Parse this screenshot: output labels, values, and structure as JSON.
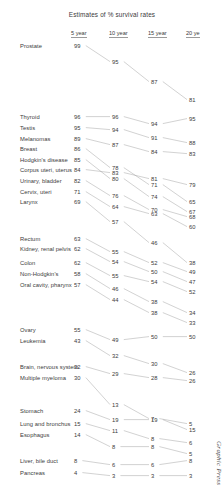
{
  "title": "Estimates of % survival rates",
  "credit": "Graphic Press",
  "columns": [
    {
      "label": "5 year",
      "x": 78
    },
    {
      "label": "10 year",
      "x": 116
    },
    {
      "label": "15 year",
      "x": 155
    },
    {
      "label": "20 ye",
      "x": 193
    }
  ],
  "axis": {
    "header_y": 30
  },
  "style": {
    "line_color": "#9a9a9a",
    "text_color": "#3b3b3b",
    "background": "#ffffff"
  },
  "chart_data": {
    "type": "line",
    "title": "Estimates of % survival rates",
    "xlabel": "",
    "ylabel": "",
    "categories": [
      "5 year",
      "10 year",
      "15 year",
      "20 year"
    ],
    "grid": false,
    "legend": "none",
    "note": "Tufte slopegraph of cancer survival rates by site",
    "series": [
      {
        "name": "Prostate",
        "values": [
          99,
          95,
          87,
          81
        ],
        "y": [
          47,
          63,
          83,
          101
        ]
      },
      {
        "name": "Thyroid",
        "values": [
          96,
          96,
          94,
          95
        ],
        "y": [
          118,
          118,
          125,
          120
        ]
      },
      {
        "name": "Testis",
        "values": [
          95,
          94,
          91,
          88
        ],
        "y": [
          129,
          131,
          139,
          144
        ]
      },
      {
        "name": "Melanomas",
        "values": [
          89,
          87,
          84,
          83
        ],
        "y": [
          140,
          146,
          153,
          155
        ]
      },
      {
        "name": "Breast",
        "values": [
          86,
          78,
          71,
          65
        ],
        "y": [
          150,
          169,
          186,
          203
        ]
      },
      {
        "name": "Hodgkin's disease",
        "values": [
          85,
          80,
          74,
          67
        ],
        "y": [
          161,
          180,
          198,
          213
        ]
      },
      {
        "name": "Corpus uteri, uterus",
        "values": [
          84,
          83,
          81,
          79
        ],
        "y": [
          171,
          174,
          180,
          186
        ]
      },
      {
        "name": "Urinary, bladder",
        "values": [
          82,
          76,
          70,
          68
        ],
        "y": [
          182,
          197,
          211,
          218
        ]
      },
      {
        "name": "Cervix, uteri",
        "values": [
          71,
          64,
          63,
          60
        ],
        "y": [
          193,
          208,
          215,
          228
        ]
      },
      {
        "name": "Larynx",
        "values": [
          69,
          57,
          46,
          38
        ],
        "y": [
          203,
          223,
          244,
          264
        ]
      },
      {
        "name": "Rectum",
        "values": [
          63,
          55,
          52,
          49
        ],
        "y": [
          240,
          253,
          264,
          273
        ]
      },
      {
        "name": "Kidney, renal pelvis",
        "values": [
          62,
          54,
          50,
          47
        ],
        "y": [
          250,
          263,
          273,
          283
        ]
      },
      {
        "name": "Colon",
        "values": [
          62,
          55,
          54,
          52
        ],
        "y": [
          264,
          277,
          283,
          293
        ]
      },
      {
        "name": "Non-Hodgkin's",
        "values": [
          58,
          46,
          38,
          34
        ],
        "y": [
          275,
          290,
          303,
          314
        ]
      },
      {
        "name": "Oral cavity, pharynx",
        "values": [
          57,
          44,
          38,
          33
        ],
        "y": [
          286,
          301,
          314,
          324
        ]
      },
      {
        "name": "Ovary",
        "values": [
          55,
          49,
          50,
          50
        ],
        "y": [
          331,
          341,
          338,
          338
        ]
      },
      {
        "name": "Leukemia",
        "values": [
          43,
          32,
          30,
          26
        ],
        "y": [
          342,
          357,
          365,
          374
        ]
      },
      {
        "name": "Brain, nervous system",
        "values": [
          32,
          29,
          28,
          26
        ],
        "y": [
          368,
          375,
          379,
          382
        ]
      },
      {
        "name": "Multiple myeloma",
        "values": [
          30,
          13,
          7,
          5
        ],
        "y": [
          379,
          406,
          420,
          425
        ]
      },
      {
        "name": "Stomach",
        "values": [
          24,
          19,
          19,
          15
        ],
        "y": [
          412,
          421,
          421,
          431
        ]
      },
      {
        "name": "Lung and bronchus",
        "values": [
          15,
          11,
          8,
          6
        ],
        "y": [
          425,
          432,
          440,
          444
        ]
      },
      {
        "name": "Esophagus",
        "values": [
          14,
          8,
          8,
          5
        ],
        "y": [
          436,
          448,
          448,
          455
        ]
      },
      {
        "name": "Liver, bile duct",
        "values": [
          8,
          6,
          6,
          8
        ],
        "y": [
          462,
          466,
          466,
          462
        ]
      },
      {
        "name": "Pancreas",
        "values": [
          4,
          3,
          3,
          3
        ],
        "y": [
          474,
          477,
          477,
          477
        ]
      }
    ]
  }
}
